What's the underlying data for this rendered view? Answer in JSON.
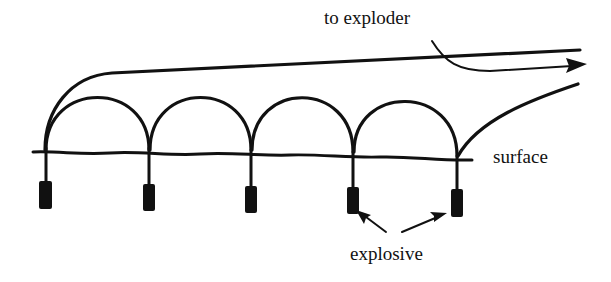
{
  "diagram": {
    "title": "",
    "labels": {
      "exploder": "to exploder",
      "surface": "surface",
      "explosive": "explosive"
    },
    "colors": {
      "ink": "#111111",
      "background": "#ffffff"
    },
    "charges": [
      {
        "id": 1,
        "x": 45
      },
      {
        "id": 2,
        "x": 149
      },
      {
        "id": 3,
        "x": 251
      },
      {
        "id": 4,
        "x": 353
      },
      {
        "id": 5,
        "x": 457
      }
    ]
  }
}
